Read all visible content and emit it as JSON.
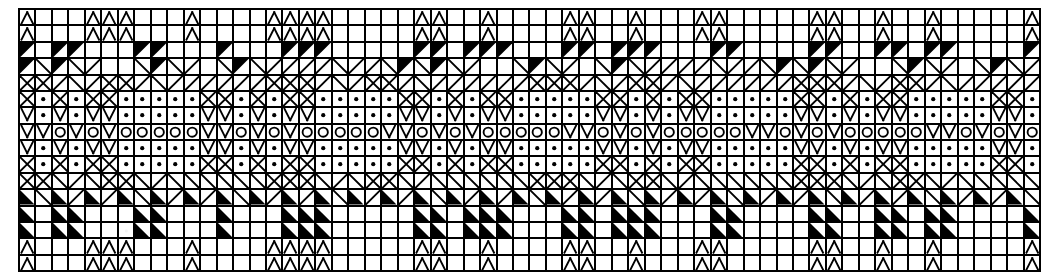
{
  "chart": {
    "kind": "knitting-stitch-chart",
    "columns": 62,
    "rows": 16,
    "cell_width_px": 16.5,
    "cell_height_px": 16.5,
    "ink_color": "#000000",
    "paper_color": "#ffffff",
    "grid_line_color": "#000000",
    "grid_line_width_px": 2,
    "legend": [
      {
        "code": "e",
        "name": "empty-cell",
        "glyph": "",
        "description": "blank square"
      },
      {
        "code": "p",
        "name": "peak-symbol",
        "glyph": "Λ",
        "description": "open chevron pointing up"
      },
      {
        "code": "v",
        "name": "vee-symbol",
        "glyph": "V",
        "description": "open chevron pointing down"
      },
      {
        "code": "o",
        "name": "circle-symbol",
        "glyph": "O",
        "description": "open ring / yarn over"
      },
      {
        "code": "d",
        "name": "dot-symbol",
        "glyph": "▪",
        "description": "filled dot centred in square"
      },
      {
        "code": "x",
        "name": "cross-symbol",
        "glyph": "✕",
        "description": "full diagonal cross"
      },
      {
        "code": "s",
        "name": "slash-symbol",
        "glyph": "/",
        "description": "rising diagonal line"
      },
      {
        "code": "b",
        "name": "backslash-symbol",
        "glyph": "\\",
        "description": "falling diagonal line"
      },
      {
        "code": "t",
        "name": "filled-triangle-upper-left",
        "glyph": "◤",
        "description": "solid black triangle, hypotenuse from lower-left to upper-right"
      },
      {
        "code": "u",
        "name": "filled-triangle-lower-left",
        "glyph": "◣",
        "description": "solid black triangle, hypotenuse from upper-left to lower-right"
      },
      {
        "code": "f",
        "name": "filled-cell",
        "glyph": "■",
        "description": "completely solid black square"
      }
    ],
    "rows_data": [
      "peeepppeeepeeeeppppeeeeeppeepeeeeppeepeeeppeeeeeppeepeepeeeeepp",
      "peeepppeeepeeeeppppeeeeeppeepeeeeppeepeeeppeeeeeppeepeepeeeeepp",
      "tetteeetteeeteeettteeeeettettteeettettteeetteeeetteettetteeeett",
      "tbtbseebtbsebtbssssbssbtbtbseebtbsebtbssssbssbtbtbseebtbsebtbss",
      "xxsbsxxsbssssssxxxsbsxxsbssssssxxxsbsxxsbssssssxxxsbsxxsbsssssx",
      "xdxdxxdddddxxdxdxxdddddxxdxdxxdddddxxdxdxxdddddxxdxdxxdddddxxdx",
      "vdvdvvdddddvvdvdvvdddddvvdvdvvdddddvvdvdvvdddddvvdvdvvdddddvvdv",
      "vvovovooooovvovovooooovvovovooooovvovovooooovvovovooooovvovovoo",
      "vdvdvvdddddvvdvdvvdddddvvdvdvvdddddvvdvdvvdddddvvdvdvvdddddvvdv",
      "xdxdxxdddddxxdxdxxdddddxxdxdxxdddddxxdxdxxdddddxxdxdxxdddddxxdx",
      "xxbsbxxbsbbbbbbxxxbsbxxbsbbbbbbxxxbsbxxbsbbbbbbxxxbsbxxbsbbbbbx",
      "ubususubususubususubususubususubususubususubususubususubususubu",
      "ueuueeeuueeeueeeuuueeeeeuueuuueeeuueuuueeeuueeeeuueeuueuueeeeuu",
      "ueuueeeuueeeueeeuuueeeeeuueuuueeeuueuuueeeuueeeeuueeuueuueeeeuu",
      "peeepppeeepeeeeppppeeeeeppeepeeeeppeepeeeppeeeeeppeepeepeeeeepp",
      "peeepppeeepeeeeppppeeeeeppeepeeeeppeepeeeppeeeeeppeepeepeeeeepp"
    ]
  }
}
